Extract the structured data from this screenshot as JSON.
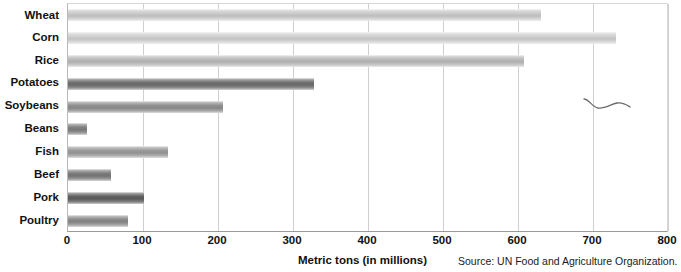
{
  "chart_data": {
    "type": "bar",
    "orientation": "horizontal",
    "title": "",
    "xlabel": "Metric tons (in millions)",
    "ylabel": "",
    "xlim": [
      0,
      800
    ],
    "xticks": [
      0,
      100,
      200,
      300,
      400,
      500,
      600,
      700,
      800
    ],
    "grid": true,
    "legend": false,
    "categories": [
      "Wheat",
      "Corn",
      "Rice",
      "Potatoes",
      "Soybeans",
      "Beans",
      "Fish",
      "Beef",
      "Pork",
      "Poultry"
    ],
    "values": [
      630,
      730,
      608,
      328,
      206,
      25,
      133,
      57,
      101,
      80
    ],
    "bar_colors": [
      "#c9c9c9",
      "#cfcfcf",
      "#b9b9b9",
      "#6f6f6f",
      "#8f8f8f",
      "#7f7f7f",
      "#9a9a9a",
      "#7a7a7a",
      "#5f5f5f",
      "#8a8a8a"
    ],
    "annotations": [
      "Source: UN Food and Agriculture Organization."
    ]
  },
  "axis": {
    "title": "Metric tons (in millions)",
    "ticks": [
      "0",
      "100",
      "200",
      "300",
      "400",
      "500",
      "600",
      "700",
      "800"
    ]
  },
  "categories": [
    {
      "label": "Wheat"
    },
    {
      "label": "Corn"
    },
    {
      "label": "Rice"
    },
    {
      "label": "Potatoes"
    },
    {
      "label": "Soybeans"
    },
    {
      "label": "Beans"
    },
    {
      "label": "Fish"
    },
    {
      "label": "Beef"
    },
    {
      "label": "Pork"
    },
    {
      "label": "Poultry"
    }
  ],
  "footer": {
    "source": "Source: UN Food and Agriculture Organization."
  }
}
